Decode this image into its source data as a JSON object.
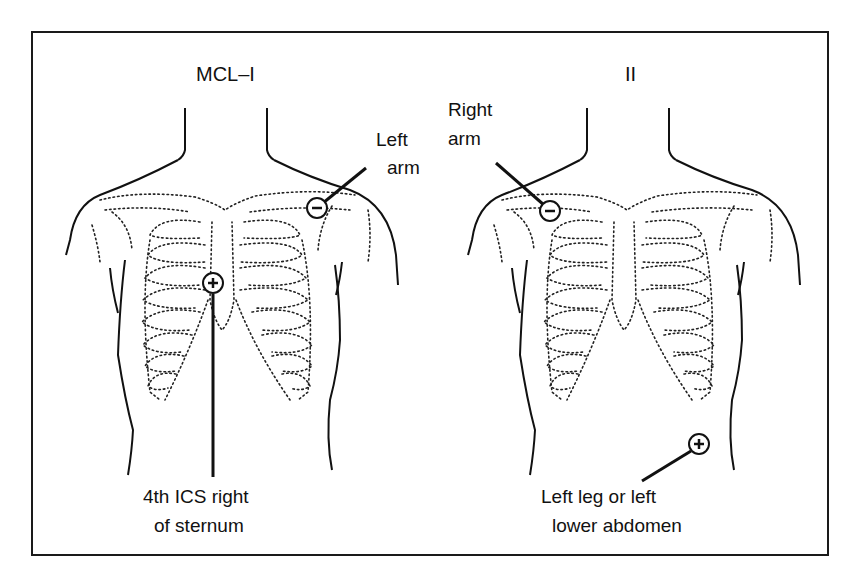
{
  "figure": {
    "panels": [
      {
        "id": "mcl1",
        "title": "MCL–I",
        "electrodes": [
          {
            "polarity": "negative",
            "symbol": "−",
            "label_lines": [
              "Left",
              "arm"
            ]
          },
          {
            "polarity": "positive",
            "symbol": "+",
            "label_lines": [
              "4th ICS right",
              "of sternum"
            ]
          }
        ]
      },
      {
        "id": "lead2",
        "title": "II",
        "electrodes": [
          {
            "polarity": "negative",
            "symbol": "−",
            "label_lines": [
              "Right",
              "arm"
            ]
          },
          {
            "polarity": "positive",
            "symbol": "+",
            "label_lines": [
              "Left leg or left",
              "lower abdomen"
            ]
          }
        ]
      }
    ],
    "colors": {
      "ink": "#111111",
      "background": "#ffffff"
    }
  }
}
